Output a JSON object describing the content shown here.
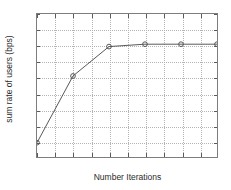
{
  "chart_data": {
    "type": "line",
    "title": "",
    "xlabel": "Number Iterations",
    "ylabel": "sum rate of users (bps)",
    "x": [
      1,
      2,
      3,
      4,
      5,
      6
    ],
    "values": [
      15.9,
      20.1,
      21.95,
      22.1,
      22.1,
      22.1
    ],
    "series": [
      {
        "name": "sum rate",
        "x": [
          1,
          2,
          3,
          4,
          5,
          6
        ],
        "values": [
          15.9,
          20.1,
          21.95,
          22.1,
          22.1,
          22.1
        ],
        "color": "#555555",
        "marker": "circle",
        "line_style": "solid"
      }
    ],
    "xlim": [
      1,
      6
    ],
    "ylim": [
      15,
      24
    ],
    "xticks": [
      1,
      1.5,
      2,
      2.5,
      3,
      3.5,
      4,
      4.5,
      5,
      5.5,
      6
    ],
    "xtick_labels": [
      "1",
      "1.5",
      "2",
      "2.5",
      "3",
      "3.5",
      "4",
      "4.5",
      "5",
      "5.5",
      "6"
    ],
    "yticks": [
      15,
      16,
      17,
      18,
      19,
      20,
      21,
      22,
      23,
      24
    ],
    "ytick_labels": [
      "15",
      "16",
      "17",
      "18",
      "19",
      "20",
      "21",
      "22",
      "23",
      "24"
    ],
    "grid": true,
    "grid_style": "dotted",
    "grid_color": "#b4b4b4",
    "legend": null,
    "legend_position": "none",
    "axis_color": "#7d7d7d",
    "background_color": "#ffffff",
    "text_color": "#2b2b2b"
  }
}
